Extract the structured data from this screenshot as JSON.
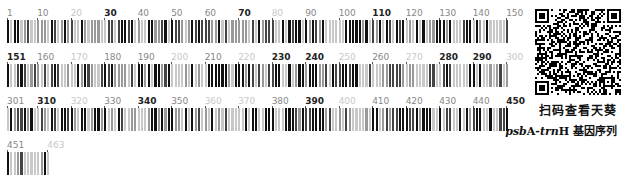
{
  "barcode": {
    "total_length": 463,
    "bases_per_row": 150,
    "colors": {
      "dark": "#111111",
      "mid": "#777777",
      "light": "#c8c8c8"
    },
    "rows": [
      {
        "start": 1,
        "end": 150,
        "labels": [
          {
            "text": "1",
            "pos": 1,
            "style": "mid"
          },
          {
            "text": "10",
            "pos": 10,
            "style": "mid"
          },
          {
            "text": "20",
            "pos": 20,
            "style": "light"
          },
          {
            "text": "30",
            "pos": 30,
            "style": "dark"
          },
          {
            "text": "40",
            "pos": 40,
            "style": "mid"
          },
          {
            "text": "50",
            "pos": 50,
            "style": "mid"
          },
          {
            "text": "60",
            "pos": 60,
            "style": "mid"
          },
          {
            "text": "70",
            "pos": 70,
            "style": "dark"
          },
          {
            "text": "80",
            "pos": 80,
            "style": "light"
          },
          {
            "text": "90",
            "pos": 90,
            "style": "mid"
          },
          {
            "text": "100",
            "pos": 100,
            "style": "mid"
          },
          {
            "text": "110",
            "pos": 110,
            "style": "dark"
          },
          {
            "text": "120",
            "pos": 120,
            "style": "mid"
          },
          {
            "text": "130",
            "pos": 130,
            "style": "mid"
          },
          {
            "text": "140",
            "pos": 140,
            "style": "mid"
          },
          {
            "text": "150",
            "pos": 150,
            "style": "mid"
          }
        ]
      },
      {
        "start": 151,
        "end": 300,
        "labels": [
          {
            "text": "151",
            "pos": 151,
            "style": "dark"
          },
          {
            "text": "160",
            "pos": 160,
            "style": "mid"
          },
          {
            "text": "170",
            "pos": 170,
            "style": "light"
          },
          {
            "text": "180",
            "pos": 180,
            "style": "mid"
          },
          {
            "text": "190",
            "pos": 190,
            "style": "mid"
          },
          {
            "text": "200",
            "pos": 200,
            "style": "light"
          },
          {
            "text": "210",
            "pos": 210,
            "style": "mid"
          },
          {
            "text": "220",
            "pos": 220,
            "style": "light"
          },
          {
            "text": "230",
            "pos": 230,
            "style": "dark"
          },
          {
            "text": "240",
            "pos": 240,
            "style": "dark"
          },
          {
            "text": "250",
            "pos": 250,
            "style": "light"
          },
          {
            "text": "260",
            "pos": 260,
            "style": "mid"
          },
          {
            "text": "270",
            "pos": 270,
            "style": "light"
          },
          {
            "text": "280",
            "pos": 280,
            "style": "dark"
          },
          {
            "text": "290",
            "pos": 290,
            "style": "dark"
          },
          {
            "text": "300",
            "pos": 300,
            "style": "light"
          }
        ]
      },
      {
        "start": 301,
        "end": 450,
        "labels": [
          {
            "text": "301",
            "pos": 301,
            "style": "mid"
          },
          {
            "text": "310",
            "pos": 310,
            "style": "dark"
          },
          {
            "text": "320",
            "pos": 320,
            "style": "light"
          },
          {
            "text": "330",
            "pos": 330,
            "style": "mid"
          },
          {
            "text": "340",
            "pos": 340,
            "style": "dark"
          },
          {
            "text": "350",
            "pos": 350,
            "style": "mid"
          },
          {
            "text": "360",
            "pos": 360,
            "style": "light"
          },
          {
            "text": "370",
            "pos": 370,
            "style": "light"
          },
          {
            "text": "380",
            "pos": 380,
            "style": "mid"
          },
          {
            "text": "390",
            "pos": 390,
            "style": "dark"
          },
          {
            "text": "400",
            "pos": 400,
            "style": "light"
          },
          {
            "text": "410",
            "pos": 410,
            "style": "mid"
          },
          {
            "text": "420",
            "pos": 420,
            "style": "mid"
          },
          {
            "text": "430",
            "pos": 430,
            "style": "mid"
          },
          {
            "text": "440",
            "pos": 440,
            "style": "mid"
          },
          {
            "text": "450",
            "pos": 450,
            "style": "dark"
          }
        ]
      },
      {
        "start": 451,
        "end": 463,
        "labels": [
          {
            "text": "451",
            "pos": 451,
            "style": "mid"
          },
          {
            "text": "463",
            "pos": 463,
            "style": "light"
          }
        ]
      }
    ]
  },
  "qr": {
    "name": "qr-code"
  },
  "caption": {
    "line1": "扫码查看天葵",
    "gene_italic_1": "psb",
    "gene_upright_1": "A-",
    "gene_italic_2": "trn",
    "gene_upright_2": "H",
    "line2_suffix": " 基因序列"
  }
}
